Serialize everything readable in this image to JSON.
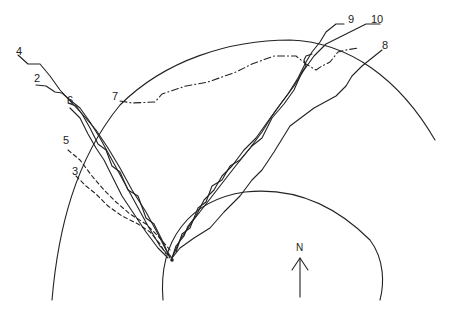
{
  "diagram": {
    "type": "track-map",
    "colors": {
      "line": "#222222",
      "background": "#ffffff"
    },
    "north_label": "N",
    "release_point": {
      "x": 172,
      "y": 260
    },
    "circles": [
      {
        "name": "outer-circle",
        "cx": 330,
        "cy": 330,
        "r": 290
      },
      {
        "name": "inner-circle",
        "cx": 272,
        "cy": 300,
        "r": 110
      }
    ],
    "tracks": [
      {
        "id": "2",
        "label": "2",
        "style": "solid",
        "label_pos": [
          34,
          73
        ]
      },
      {
        "id": "3",
        "label": "3",
        "style": "dashed",
        "label_pos": [
          72,
          166
        ]
      },
      {
        "id": "4",
        "label": "4",
        "style": "solid",
        "label_pos": [
          16,
          46
        ]
      },
      {
        "id": "5",
        "label": "5",
        "style": "dashed",
        "label_pos": [
          63,
          135
        ]
      },
      {
        "id": "6",
        "label": "6",
        "style": "solid",
        "label_pos": [
          67,
          95
        ]
      },
      {
        "id": "7",
        "label": "7",
        "style": "dash-dot",
        "label_pos": [
          112,
          91
        ]
      },
      {
        "id": "8",
        "label": "8",
        "style": "solid",
        "label_pos": [
          382,
          40
        ]
      },
      {
        "id": "9",
        "label": "9",
        "style": "solid",
        "label_pos": [
          348,
          14
        ]
      },
      {
        "id": "10",
        "label": "10",
        "style": "solid",
        "label_pos": [
          371,
          14
        ]
      }
    ]
  }
}
